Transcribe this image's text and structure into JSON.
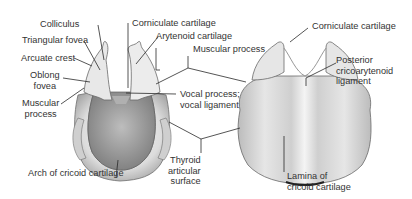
{
  "figure": {
    "left_view": "Superior/anterior view with arch of cricoid",
    "right_view": "Posterior view with lamina of cricoid"
  },
  "labels": {
    "colliculus": "Colliculus",
    "triangular_fovea": "Triangular fovea",
    "arcuate_crest": "Arcuate crest",
    "oblong_fovea_1": "Oblong",
    "oblong_fovea_2": "fovea",
    "muscular_process_left_1": "Muscular",
    "muscular_process_left_2": "process",
    "arch_cricoid": "Arch of cricoid cartilage",
    "corniculate_center": "Corniculate cartilage",
    "arytenoid": "Arytenoid cartilage",
    "muscular_process_center": "Muscular process",
    "vocal_process_1": "Vocal process;",
    "vocal_process_2": "vocal ligament",
    "thyroid_1": "Thyroid",
    "thyroid_2": "articular",
    "thyroid_3": "surface",
    "corniculate_right": "Corniculate cartilage",
    "posterior_1": "Posterior",
    "posterior_2": "cricoarytenoid",
    "posterior_3": "ligament",
    "lamina_1": "Lamina of",
    "lamina_2": "cricoid cartilage"
  },
  "colors": {
    "text": "#333333",
    "line": "#2a2a2a",
    "cartilage_light": "#f2f2f2",
    "cartilage_mid": "#d4d4d4",
    "cartilage_dark": "#9a9a9a",
    "cavity": "#8c8c8c"
  }
}
